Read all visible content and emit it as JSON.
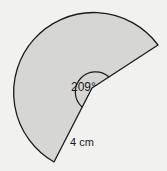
{
  "diagram": {
    "type": "sector",
    "angle_label": "209°",
    "angle_degrees": 209,
    "radius_label": "4 cm",
    "colors": {
      "fill": "#d6d6d4",
      "stroke": "#1a1a1a",
      "background": "#f1f1ef"
    }
  }
}
